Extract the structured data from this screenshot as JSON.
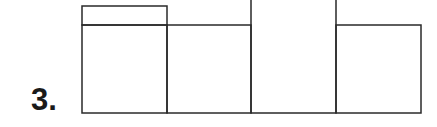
{
  "question": {
    "number_label": "3."
  },
  "figure": {
    "type": "net-of-squares",
    "stroke_color": "#2a2a2a",
    "background": "#ffffff",
    "cells": [
      {
        "id": "cell-1",
        "x": 82,
        "y": 25,
        "w": 85,
        "h": 88
      },
      {
        "id": "cell-1-top-strip",
        "x": 82,
        "y": 6,
        "w": 85,
        "h": 19
      },
      {
        "id": "cell-2",
        "x": 167,
        "y": 25,
        "w": 84,
        "h": 88
      },
      {
        "id": "cell-3",
        "x": 251,
        "y": 0,
        "w": 85,
        "h": 113
      },
      {
        "id": "cell-4",
        "x": 336,
        "y": 25,
        "w": 85,
        "h": 88
      }
    ]
  }
}
